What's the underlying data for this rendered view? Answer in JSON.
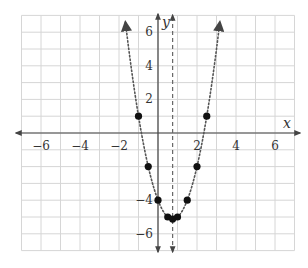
{
  "chart_data": {
    "type": "line",
    "title": "",
    "xlabel": "x",
    "ylabel": "y",
    "xlim": [
      -7,
      7
    ],
    "ylim": [
      -7,
      7
    ],
    "grid": true,
    "x_tick_labels": [
      "−6",
      "−4",
      "−2",
      "2",
      "4",
      "6"
    ],
    "x_ticks": [
      -6,
      -4,
      -2,
      2,
      4,
      6
    ],
    "y_tick_labels": [
      "6",
      "4",
      "2",
      "−4",
      "−6"
    ],
    "y_ticks": [
      6,
      4,
      2,
      -4,
      -6
    ],
    "series": [
      {
        "name": "y = 2x² − 3x − 4",
        "style": "dotted",
        "equation": "y = 2x^2 - 3x - 4",
        "points": [
          {
            "x": -1,
            "y": 1
          },
          {
            "x": -0.5,
            "y": -2
          },
          {
            "x": 0,
            "y": -4
          },
          {
            "x": 0.5,
            "y": -5
          },
          {
            "x": 0.75,
            "y": -5.125
          },
          {
            "x": 1,
            "y": -5
          },
          {
            "x": 1.5,
            "y": -4
          },
          {
            "x": 2,
            "y": -2
          },
          {
            "x": 2.5,
            "y": 1
          }
        ]
      }
    ],
    "annotations": [
      {
        "type": "axis_of_symmetry",
        "style": "dashed",
        "x": 0.75
      }
    ]
  },
  "colors": {
    "grid": "#d6d6d6",
    "axis": "#444444",
    "curve": "#555555",
    "points": "#111111"
  }
}
